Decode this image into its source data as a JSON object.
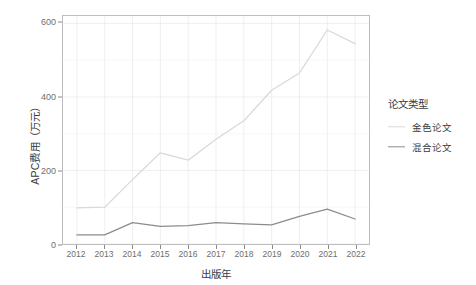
{
  "chart_data": {
    "type": "line",
    "title": "",
    "xlabel": "出版年",
    "ylabel": "APC费用（万元）",
    "categories": [
      "2012",
      "2013",
      "2014",
      "2015",
      "2016",
      "2017",
      "2018",
      "2019",
      "2020",
      "2021",
      "2022"
    ],
    "x": [
      2012,
      2013,
      2014,
      2015,
      2016,
      2017,
      2018,
      2019,
      2020,
      2021,
      2022
    ],
    "series": [
      {
        "name": "金色论文",
        "color": "#d9d9d9",
        "values": [
          98,
          100,
          175,
          248,
          228,
          285,
          335,
          418,
          465,
          582,
          545
        ]
      },
      {
        "name": "混合论文",
        "color": "#8c8c8c",
        "values": [
          25,
          25,
          58,
          48,
          50,
          58,
          55,
          52,
          75,
          95,
          68
        ]
      }
    ],
    "ylim": [
      0,
      620
    ],
    "yticks": [
      0,
      200,
      400,
      600
    ],
    "ytick_labels": [
      "0",
      "200",
      "400",
      "600"
    ],
    "xlim": [
      2012,
      2022
    ],
    "grid": true,
    "legend_position": "right"
  },
  "legend": {
    "title": "论文类型",
    "entries": [
      {
        "label": "金色论文",
        "color": "#d9d9d9"
      },
      {
        "label": "混合论文",
        "color": "#8c8c8c"
      }
    ]
  },
  "axes": {
    "y_title": "APC费用（万元）",
    "x_title": "出版年"
  },
  "colors": {
    "panel_border": "#bdbdbd",
    "grid_major": "#ebebeb",
    "grid_minor": "#f2f2f2",
    "tick_text": "#6e6e6e",
    "axis_text": "#3a3a3a",
    "background": "#ffffff"
  }
}
